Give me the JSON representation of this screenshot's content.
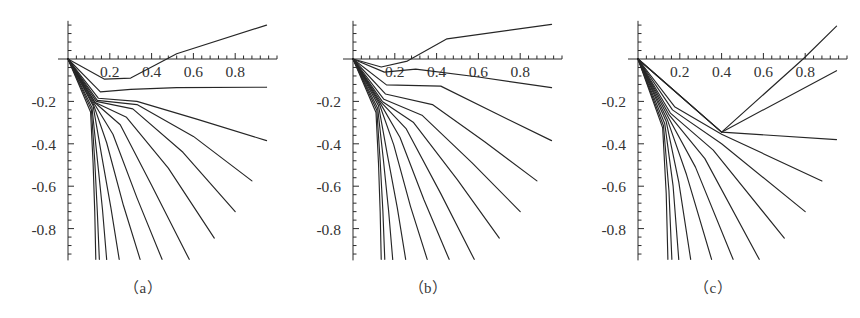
{
  "figure": {
    "background_color": "#ffffff",
    "line_color": "#262626",
    "axis_color": "#2b2b2b",
    "label_color": "#333333"
  },
  "panels": [
    {
      "id": "a",
      "caption": "（a）"
    },
    {
      "id": "b",
      "caption": "（b）"
    },
    {
      "id": "c",
      "caption": "（c）"
    }
  ],
  "chart_data": [
    {
      "type": "line",
      "title": "(a)",
      "xlabel": "",
      "ylabel": "",
      "xlim": [
        0.0,
        1.0
      ],
      "ylim": [
        -0.95,
        0.18
      ],
      "grid": false,
      "legend": false,
      "xticks": [
        0.2,
        0.4,
        0.6,
        0.8
      ],
      "xtick_labels": [
        "0.2",
        "0.4",
        "0.6",
        "0.8"
      ],
      "yticks": [
        -0.2,
        -0.4,
        -0.6,
        -0.8
      ],
      "ytick_labels": [
        "-0.2",
        "-0.4",
        "-0.6",
        "-0.8"
      ],
      "xminor_step": 0.04,
      "yminor_step": 0.04,
      "series": [
        {
          "name": "c1",
          "x": [
            0.0,
            0.175,
            0.3,
            0.52,
            0.95
          ],
          "y": [
            0.0,
            -0.095,
            -0.09,
            0.025,
            0.16
          ]
        },
        {
          "name": "c2",
          "x": [
            0.0,
            0.155,
            0.3,
            0.52,
            0.95
          ],
          "y": [
            0.0,
            -0.155,
            -0.143,
            -0.135,
            -0.133
          ]
        },
        {
          "name": "c3",
          "x": [
            0.0,
            0.145,
            0.33,
            0.62,
            0.95
          ],
          "y": [
            0.0,
            -0.185,
            -0.2,
            -0.285,
            -0.385
          ]
        },
        {
          "name": "c4",
          "x": [
            0.0,
            0.14,
            0.33,
            0.6,
            0.88
          ],
          "y": [
            0.0,
            -0.195,
            -0.215,
            -0.365,
            -0.575
          ]
        },
        {
          "name": "c5",
          "x": [
            0.0,
            0.135,
            0.31,
            0.55,
            0.8
          ],
          "y": [
            0.0,
            -0.2,
            -0.235,
            -0.44,
            -0.72
          ]
        },
        {
          "name": "c6",
          "x": [
            0.0,
            0.13,
            0.28,
            0.48,
            0.7
          ],
          "y": [
            0.0,
            -0.205,
            -0.275,
            -0.515,
            -0.845
          ]
        },
        {
          "name": "c7",
          "x": [
            0.0,
            0.128,
            0.25,
            0.4,
            0.58
          ],
          "y": [
            0.0,
            -0.205,
            -0.31,
            -0.595,
            -0.945
          ]
        },
        {
          "name": "c8",
          "x": [
            0.0,
            0.125,
            0.215,
            0.33,
            0.45
          ],
          "y": [
            0.0,
            -0.21,
            -0.355,
            -0.655,
            -0.945
          ]
        },
        {
          "name": "c9",
          "x": [
            0.0,
            0.122,
            0.185,
            0.265,
            0.345
          ],
          "y": [
            0.0,
            -0.215,
            -0.395,
            -0.69,
            -0.945
          ]
        },
        {
          "name": "c10",
          "x": [
            0.0,
            0.12,
            0.16,
            0.205,
            0.245
          ],
          "y": [
            0.0,
            -0.22,
            -0.45,
            -0.7,
            -0.945
          ]
        },
        {
          "name": "c11",
          "x": [
            0.0,
            0.115,
            0.14,
            0.165,
            0.185
          ],
          "y": [
            0.0,
            -0.23,
            -0.47,
            -0.71,
            -0.945
          ]
        },
        {
          "name": "c12",
          "x": [
            0.0,
            0.112,
            0.128,
            0.14,
            0.15
          ],
          "y": [
            0.0,
            -0.24,
            -0.48,
            -0.715,
            -0.945
          ]
        },
        {
          "name": "c13",
          "x": [
            0.0,
            0.108,
            0.12,
            0.128,
            0.133
          ],
          "y": [
            0.0,
            -0.25,
            -0.49,
            -0.72,
            -0.945
          ]
        }
      ]
    },
    {
      "type": "line",
      "title": "(b)",
      "xlabel": "",
      "ylabel": "",
      "xlim": [
        0.0,
        1.0
      ],
      "ylim": [
        -0.95,
        0.18
      ],
      "grid": false,
      "legend": false,
      "xticks": [
        0.2,
        0.4,
        0.6,
        0.8
      ],
      "xtick_labels": [
        "0.2",
        "0.4",
        "0.6",
        "0.8"
      ],
      "yticks": [
        -0.2,
        -0.4,
        -0.6,
        -0.8
      ],
      "ytick_labels": [
        "-0.2",
        "-0.4",
        "-0.6",
        "-0.8"
      ],
      "xminor_step": 0.04,
      "yminor_step": 0.04,
      "series": [
        {
          "name": "c1",
          "x": [
            0.0,
            0.135,
            0.26,
            0.45,
            0.95
          ],
          "y": [
            0.0,
            -0.038,
            -0.01,
            0.095,
            0.163
          ]
        },
        {
          "name": "c2",
          "x": [
            0.0,
            0.15,
            0.3,
            0.6,
            0.95
          ],
          "y": [
            0.0,
            -0.062,
            -0.048,
            -0.085,
            -0.135
          ]
        },
        {
          "name": "c3",
          "x": [
            0.0,
            0.16,
            0.42,
            0.68,
            0.95
          ],
          "y": [
            0.0,
            -0.122,
            -0.128,
            -0.255,
            -0.385
          ]
        },
        {
          "name": "c4",
          "x": [
            0.0,
            0.155,
            0.38,
            0.63,
            0.88
          ],
          "y": [
            0.0,
            -0.165,
            -0.215,
            -0.39,
            -0.575
          ]
        },
        {
          "name": "c5",
          "x": [
            0.0,
            0.148,
            0.33,
            0.57,
            0.8
          ],
          "y": [
            0.0,
            -0.19,
            -0.265,
            -0.49,
            -0.72
          ]
        },
        {
          "name": "c6",
          "x": [
            0.0,
            0.14,
            0.29,
            0.5,
            0.7
          ],
          "y": [
            0.0,
            -0.2,
            -0.3,
            -0.57,
            -0.845
          ]
        },
        {
          "name": "c7",
          "x": [
            0.0,
            0.135,
            0.255,
            0.42,
            0.58
          ],
          "y": [
            0.0,
            -0.205,
            -0.33,
            -0.635,
            -0.945
          ]
        },
        {
          "name": "c8",
          "x": [
            0.0,
            0.13,
            0.225,
            0.34,
            0.46
          ],
          "y": [
            0.0,
            -0.208,
            -0.37,
            -0.665,
            -0.945
          ]
        },
        {
          "name": "c9",
          "x": [
            0.0,
            0.126,
            0.195,
            0.275,
            0.355
          ],
          "y": [
            0.0,
            -0.212,
            -0.405,
            -0.695,
            -0.945
          ]
        },
        {
          "name": "c10",
          "x": [
            0.0,
            0.122,
            0.165,
            0.212,
            0.252
          ],
          "y": [
            0.0,
            -0.22,
            -0.455,
            -0.702,
            -0.945
          ]
        },
        {
          "name": "c11",
          "x": [
            0.0,
            0.118,
            0.145,
            0.17,
            0.19
          ],
          "y": [
            0.0,
            -0.232,
            -0.472,
            -0.712,
            -0.945
          ]
        },
        {
          "name": "c12",
          "x": [
            0.0,
            0.114,
            0.13,
            0.143,
            0.152
          ],
          "y": [
            0.0,
            -0.242,
            -0.482,
            -0.718,
            -0.945
          ]
        },
        {
          "name": "c13",
          "x": [
            0.0,
            0.11,
            0.122,
            0.13,
            0.135
          ],
          "y": [
            0.0,
            -0.252,
            -0.492,
            -0.722,
            -0.945
          ]
        }
      ]
    },
    {
      "type": "line",
      "title": "(c)",
      "xlabel": "",
      "ylabel": "",
      "xlim": [
        0.0,
        1.0
      ],
      "ylim": [
        -0.95,
        0.18
      ],
      "grid": false,
      "legend": false,
      "xticks": [
        0.2,
        0.4,
        0.6,
        0.8
      ],
      "xtick_labels": [
        "0.2",
        "0.4",
        "0.6",
        "0.8"
      ],
      "yticks": [
        -0.2,
        -0.4,
        -0.6,
        -0.8
      ],
      "ytick_labels": [
        "-0.2",
        "-0.4",
        "-0.6",
        "-0.8"
      ],
      "xminor_step": 0.04,
      "yminor_step": 0.04,
      "crossing_node": [
        0.4,
        -0.345
      ],
      "series": [
        {
          "name": "c1",
          "x": [
            0.0,
            0.4,
            0.79,
            0.95
          ],
          "y": [
            0.0,
            -0.345,
            0.0,
            0.155
          ]
        },
        {
          "name": "c2",
          "x": [
            0.0,
            0.4,
            0.95
          ],
          "y": [
            0.0,
            -0.345,
            -0.055
          ]
        },
        {
          "name": "c3",
          "x": [
            0.0,
            0.4,
            0.95
          ],
          "y": [
            0.0,
            -0.345,
            -0.38
          ]
        },
        {
          "name": "c4",
          "x": [
            0.0,
            0.175,
            0.4,
            0.88
          ],
          "y": [
            0.0,
            -0.225,
            -0.355,
            -0.575
          ]
        },
        {
          "name": "c5",
          "x": [
            0.0,
            0.165,
            0.4,
            0.8
          ],
          "y": [
            0.0,
            -0.24,
            -0.4,
            -0.72
          ]
        },
        {
          "name": "c6",
          "x": [
            0.0,
            0.155,
            0.36,
            0.7
          ],
          "y": [
            0.0,
            -0.255,
            -0.43,
            -0.845
          ]
        },
        {
          "name": "c7",
          "x": [
            0.0,
            0.15,
            0.32,
            0.58
          ],
          "y": [
            0.0,
            -0.265,
            -0.47,
            -0.945
          ]
        },
        {
          "name": "c8",
          "x": [
            0.0,
            0.145,
            0.275,
            0.455
          ],
          "y": [
            0.0,
            -0.275,
            -0.51,
            -0.945
          ]
        },
        {
          "name": "c9",
          "x": [
            0.0,
            0.14,
            0.232,
            0.352
          ],
          "y": [
            0.0,
            -0.285,
            -0.545,
            -0.945
          ]
        },
        {
          "name": "c10",
          "x": [
            0.0,
            0.135,
            0.195,
            0.252
          ],
          "y": [
            0.0,
            -0.295,
            -0.58,
            -0.945
          ]
        },
        {
          "name": "c11",
          "x": [
            0.0,
            0.128,
            0.168,
            0.195
          ],
          "y": [
            0.0,
            -0.305,
            -0.6,
            -0.945
          ]
        },
        {
          "name": "c12",
          "x": [
            0.0,
            0.122,
            0.148,
            0.162
          ],
          "y": [
            0.0,
            -0.315,
            -0.62,
            -0.945
          ]
        },
        {
          "name": "c13",
          "x": [
            0.0,
            0.118,
            0.135,
            0.143
          ],
          "y": [
            0.0,
            -0.325,
            -0.635,
            -0.945
          ]
        }
      ]
    }
  ]
}
